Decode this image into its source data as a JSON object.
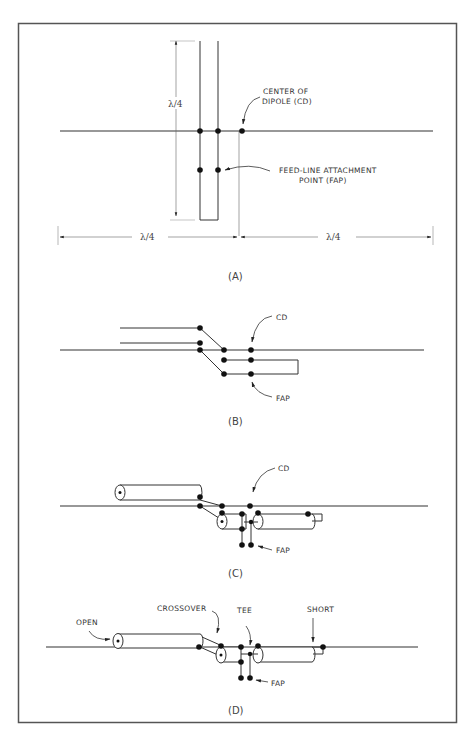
{
  "figure": {
    "panels": [
      {
        "id": "A",
        "label": "(A)",
        "annotations": {
          "center_of_dipole": [
            "CENTER OF",
            "DIPOLE (CD)"
          ],
          "feed_line_attachment": [
            "FEED-LINE ATTACHMENT",
            "POINT (FAP)"
          ]
        },
        "dimensions": {
          "stub_length": "λ/4",
          "left_arm": "λ/4",
          "right_arm": "λ/4"
        }
      },
      {
        "id": "B",
        "label": "(B)",
        "annotations": {
          "cd": "CD",
          "fap": "FAP"
        }
      },
      {
        "id": "C",
        "label": "(C)",
        "annotations": {
          "cd": "CD",
          "fap": "FAP"
        }
      },
      {
        "id": "D",
        "label": "(D)",
        "annotations": {
          "open": "OPEN",
          "crossover": "CROSSOVER",
          "tee": "TEE",
          "short": "SHORT",
          "fap": "FAP"
        }
      }
    ]
  }
}
